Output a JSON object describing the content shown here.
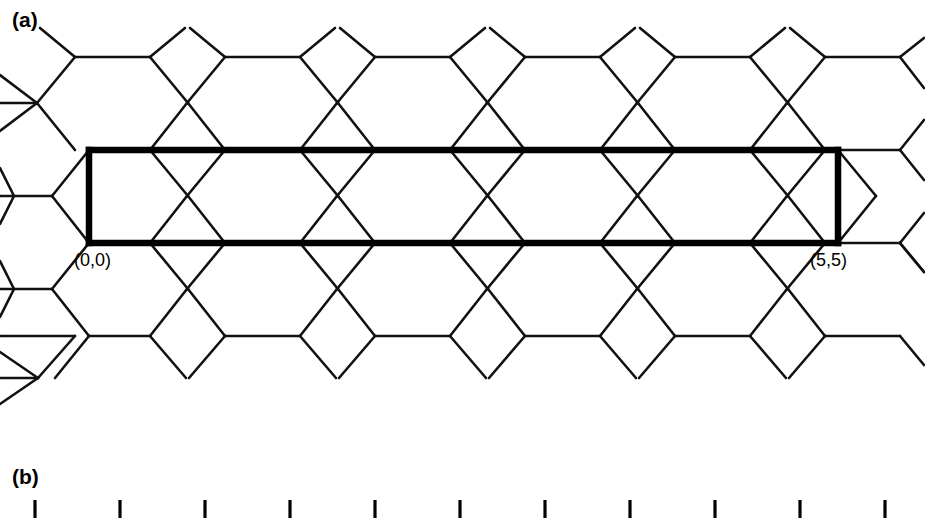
{
  "figure": {
    "background_color": "#ffffff",
    "line_color": "#111111",
    "bold_line_color": "#000000",
    "width": 925,
    "height": 517
  },
  "panels": {
    "a": {
      "label": "(a)",
      "description": "honeycomb (graphene) lattice with bold rectangle marking the unrolled unit cell of a (5,5) armchair nanotube",
      "origin_label": "(0,0)",
      "end_label": "(5,5)",
      "unit_cell": {
        "left_x": 89,
        "right_x": 838,
        "top_y": 150,
        "bottom_y": 243,
        "hexagons_enclosed": 5
      }
    },
    "b": {
      "label": "(b)",
      "description": "row of vertical tick marks (ruler / axis) below panel a",
      "tick_count": 11,
      "tick_first_x": 35,
      "tick_spacing": 85,
      "tick_top_y": 500,
      "tick_bottom_y": 517
    }
  },
  "lattice": {
    "orientation": "armchair-horizontal",
    "period_x": 150,
    "row_ys": [
      57,
      150,
      243,
      336
    ],
    "hex_half_width": 37,
    "hex_slant_dx": 38,
    "hex_slant_dy": 46
  }
}
